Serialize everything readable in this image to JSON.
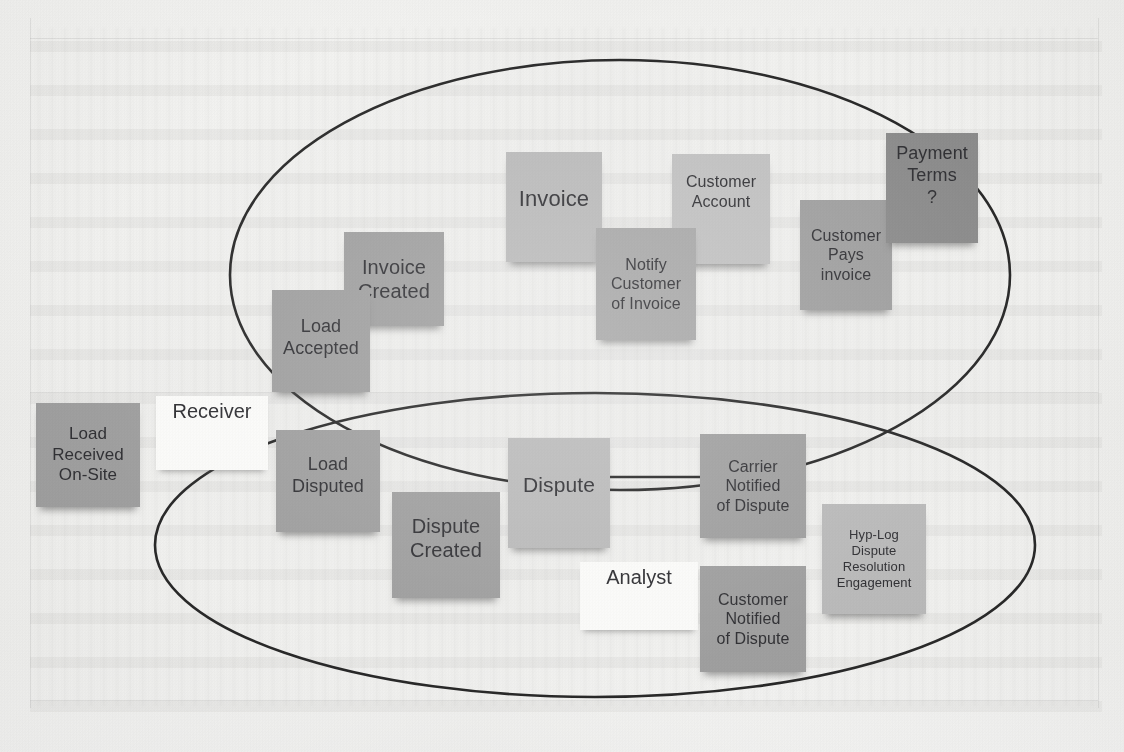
{
  "figure": {
    "kind": "event-storming-sticky-note-board"
  },
  "boundaries": [
    {
      "id": "invoice-boundary",
      "label": ""
    },
    {
      "id": "dispute-boundary",
      "label": ""
    }
  ],
  "actors": [
    {
      "id": "receiver",
      "label": "Receiver"
    },
    {
      "id": "analyst",
      "label": "Analyst"
    }
  ],
  "notes": [
    {
      "id": "load-received-on-site",
      "label": "Load Received On-Site",
      "tone": "mid"
    },
    {
      "id": "load-accepted",
      "label": "Load Accepted",
      "tone": "mid"
    },
    {
      "id": "invoice-created",
      "label": "Invoice Created",
      "tone": "mid"
    },
    {
      "id": "invoice",
      "label": "Invoice",
      "tone": "light"
    },
    {
      "id": "notify-customer-of-invoice",
      "label": "Notify Customer of Invoice",
      "tone": "midsoft"
    },
    {
      "id": "customer-account",
      "label": "Customer Account",
      "tone": "lighter"
    },
    {
      "id": "customer-pays-invoice",
      "label": "Customer Pays invoice",
      "tone": "mid"
    },
    {
      "id": "payment-terms",
      "label": "Payment Terms ?",
      "tone": "dark"
    },
    {
      "id": "load-disputed",
      "label": "Load Disputed",
      "tone": "mid"
    },
    {
      "id": "dispute-created",
      "label": "Dispute Created",
      "tone": "mid"
    },
    {
      "id": "dispute",
      "label": "Dispute",
      "tone": "light"
    },
    {
      "id": "carrier-notified-of-dispute",
      "label": "Carrier Notified of Dispute",
      "tone": "mid"
    },
    {
      "id": "customer-notified-of-dispute",
      "label": "Customer Notified of Dispute",
      "tone": "mid"
    },
    {
      "id": "hyp-log-dispute-resolution-engagement",
      "label": "Hyp-Log Dispute Resolution Engagement",
      "tone": "light"
    }
  ],
  "note_text": {
    "load_received_on_site": {
      "l1": "Load",
      "l2": "Received",
      "l3": "On-Site"
    },
    "load_accepted": {
      "l1": "Load",
      "l2": "Accepted"
    },
    "invoice_created": {
      "l1": "Invoice",
      "l2": "Created"
    },
    "invoice": {
      "l1": "Invoice"
    },
    "notify_customer_of_invoice": {
      "l1": "Notify",
      "l2": "Customer",
      "l3": "of Invoice"
    },
    "customer_account": {
      "l1": "Customer",
      "l2": "Account"
    },
    "customer_pays_invoice": {
      "l1": "Customer",
      "l2": "Pays",
      "l3": "invoice"
    },
    "payment_terms": {
      "l1": "Payment",
      "l2": "Terms",
      "l3": "?"
    },
    "load_disputed": {
      "l1": "Load",
      "l2": "Disputed"
    },
    "dispute_created": {
      "l1": "Dispute",
      "l2": "Created"
    },
    "dispute": {
      "l1": "Dispute"
    },
    "carrier_notified": {
      "l1": "Carrier",
      "l2": "Notified",
      "l3": "of Dispute"
    },
    "customer_notified": {
      "l1": "Customer",
      "l2": "Notified",
      "l3": "of Dispute"
    },
    "hyp_log": {
      "l1": "Hyp-Log",
      "l2": "Dispute",
      "l3": "Resolution",
      "l4": "Engagement"
    },
    "receiver": {
      "l1": "Receiver"
    },
    "analyst": {
      "l1": "Analyst"
    }
  },
  "colors": {
    "paper": "#f2f2f0",
    "ink": "#26262a",
    "outline": "#1d1d1d",
    "note_mid": "#9a9a9a",
    "note_midsoft": "#a3a3a3",
    "note_light": "#b6b6b6",
    "note_lighter": "#bdbdbd",
    "note_dark": "#868686",
    "note_white": "#f7f7f5"
  }
}
